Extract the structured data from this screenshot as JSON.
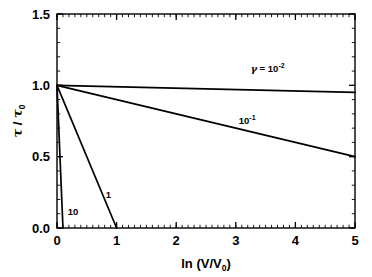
{
  "figure": {
    "background_color": "#ffffff",
    "line_color": "#000000"
  },
  "chart_data": {
    "type": "line",
    "title": "",
    "xlabel": "ln (V/V0)",
    "xlabel_main": "ln (V/V",
    "xlabel_sub": "0",
    "xlabel_close": ")",
    "ylabel": "τ / τ0",
    "ylabel_tau": "τ",
    "ylabel_slash": " / ",
    "ylabel_tau2": "τ",
    "ylabel_sub": "0",
    "xlim": [
      0,
      5
    ],
    "ylim": [
      0.0,
      1.5
    ],
    "xticks": [
      0,
      1,
      2,
      3,
      4,
      5
    ],
    "xtick_labels": [
      "0",
      "1",
      "2",
      "3",
      "4",
      "5"
    ],
    "yticks": [
      0.0,
      0.5,
      1.0,
      1.5
    ],
    "ytick_labels": [
      "0.0",
      "0.5",
      "1.0",
      "1.5"
    ],
    "x_minor_step": 0.1,
    "y_minor_step": 0.1,
    "grid": false,
    "legend": "inline-annotations",
    "series": [
      {
        "name": "gamma = 10^-2",
        "gamma": 0.01,
        "x": [
          0,
          5
        ],
        "values": [
          1.0,
          0.95
        ],
        "label_text": "γ = 10",
        "label_exponent": "-2",
        "label_prefix_greek": "γ",
        "label_equals": " = 10",
        "label_x": 3.25,
        "label_y": 1.09
      },
      {
        "name": "gamma = 10^-1",
        "gamma": 0.1,
        "x": [
          0,
          5
        ],
        "values": [
          1.0,
          0.5
        ],
        "label_text": "10",
        "label_exponent": "-1",
        "label_x": 3.05,
        "label_y": 0.73
      },
      {
        "name": "gamma = 1",
        "gamma": 1.0,
        "x": [
          0,
          1
        ],
        "values": [
          1.0,
          0.0
        ],
        "label_text": "1",
        "label_exponent": "",
        "label_x": 0.82,
        "label_y": 0.21
      },
      {
        "name": "gamma = 10",
        "gamma": 10.0,
        "x": [
          0,
          0.1
        ],
        "values": [
          1.0,
          0.0
        ],
        "label_text": "10",
        "label_exponent": "",
        "label_x": 0.18,
        "label_y": 0.09
      }
    ]
  }
}
